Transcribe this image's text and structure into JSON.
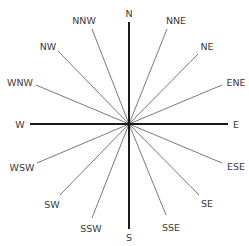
{
  "diagram": {
    "center": [
      129,
      124
    ],
    "colors": {
      "cardinal": "#1a1a1a",
      "minor": "#6a6a6a",
      "label": "#3a3a3a",
      "background": "#ffffff"
    },
    "cardinals": [
      {
        "id": "N",
        "label": "N",
        "end": [
          129,
          22
        ],
        "text": [
          129,
          17
        ],
        "anchor": "middle"
      },
      {
        "id": "S",
        "label": "S",
        "end": [
          129,
          229
        ],
        "text": [
          129,
          241
        ],
        "anchor": "middle"
      },
      {
        "id": "W",
        "label": "W",
        "end": [
          30,
          124
        ],
        "text": [
          20,
          128
        ],
        "anchor": "middle"
      },
      {
        "id": "E",
        "label": "E",
        "end": [
          228,
          124
        ],
        "text": [
          236,
          128
        ],
        "anchor": "middle"
      }
    ],
    "intercardinals": [
      {
        "id": "NNW",
        "label": "NNW",
        "end": [
          92,
          29
        ],
        "text": [
          84,
          24
        ],
        "anchor": "middle"
      },
      {
        "id": "NW",
        "label": "NW",
        "end": [
          58,
          51
        ],
        "text": [
          48,
          50
        ],
        "anchor": "middle"
      },
      {
        "id": "WNW",
        "label": "WNW",
        "end": [
          36,
          85
        ],
        "text": [
          20,
          86
        ],
        "anchor": "middle"
      },
      {
        "id": "NNE",
        "label": "NNE",
        "end": [
          167,
          29
        ],
        "text": [
          176,
          24
        ],
        "anchor": "middle"
      },
      {
        "id": "NE",
        "label": "NE",
        "end": [
          198,
          54
        ],
        "text": [
          207,
          50
        ],
        "anchor": "middle"
      },
      {
        "id": "ENE",
        "label": "ENE",
        "end": [
          222,
          85
        ],
        "text": [
          236,
          86
        ],
        "anchor": "middle"
      },
      {
        "id": "WSW",
        "label": "WSW",
        "end": [
          37,
          163
        ],
        "text": [
          22,
          171
        ],
        "anchor": "middle"
      },
      {
        "id": "SW",
        "label": "SW",
        "end": [
          60,
          195
        ],
        "text": [
          52,
          208
        ],
        "anchor": "middle"
      },
      {
        "id": "SSW",
        "label": "SSW",
        "end": [
          92,
          218
        ],
        "text": [
          91,
          232
        ],
        "anchor": "middle"
      },
      {
        "id": "ESE",
        "label": "ESE",
        "end": [
          222,
          163
        ],
        "text": [
          236,
          170
        ],
        "anchor": "middle"
      },
      {
        "id": "SE",
        "label": "SE",
        "end": [
          199,
          195
        ],
        "text": [
          207,
          207
        ],
        "anchor": "middle"
      },
      {
        "id": "SSE",
        "label": "SSE",
        "end": [
          166,
          215
        ],
        "text": [
          171,
          231
        ],
        "anchor": "middle"
      }
    ]
  }
}
